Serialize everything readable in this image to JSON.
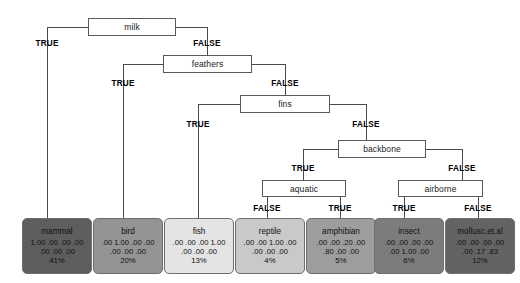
{
  "diagram": {
    "type": "decision-tree",
    "internal_nodes": [
      {
        "id": "milk",
        "label": "milk",
        "x": 88,
        "y": 18,
        "w": 88,
        "h": 18
      },
      {
        "id": "feathers",
        "label": "feathers",
        "x": 163,
        "y": 55,
        "w": 89,
        "h": 18
      },
      {
        "id": "fins",
        "label": "fins",
        "x": 240,
        "y": 95,
        "w": 90,
        "h": 18
      },
      {
        "id": "backbone",
        "label": "backbone",
        "x": 338,
        "y": 140,
        "w": 88,
        "h": 18
      },
      {
        "id": "aquatic",
        "label": "aquatic",
        "x": 262,
        "y": 180,
        "w": 84,
        "h": 17
      },
      {
        "id": "airborne",
        "label": "airborne",
        "x": 398,
        "y": 180,
        "w": 85,
        "h": 17
      }
    ],
    "edge_labels": [
      {
        "id": "milk-true",
        "text": "TRUE",
        "x": 47,
        "y": 39
      },
      {
        "id": "milk-false",
        "text": "FALSE",
        "x": 207,
        "y": 39
      },
      {
        "id": "feathers-true",
        "text": "TRUE",
        "x": 123,
        "y": 79
      },
      {
        "id": "feathers-false",
        "text": "FALSE",
        "x": 285,
        "y": 79
      },
      {
        "id": "fins-true",
        "text": "TRUE",
        "x": 198,
        "y": 120
      },
      {
        "id": "fins-false",
        "text": "FALSE",
        "x": 366,
        "y": 120
      },
      {
        "id": "backbone-true",
        "text": "TRUE",
        "x": 303,
        "y": 164
      },
      {
        "id": "backbone-false",
        "text": "FALSE",
        "x": 462,
        "y": 164
      },
      {
        "id": "aquatic-false",
        "text": "FALSE",
        "x": 267,
        "y": 204
      },
      {
        "id": "aquatic-true",
        "text": "TRUE",
        "x": 340,
        "y": 204
      },
      {
        "id": "airborne-true",
        "text": "TRUE",
        "x": 404,
        "y": 204
      },
      {
        "id": "airborne-false",
        "text": "FALSE",
        "x": 478,
        "y": 204
      }
    ],
    "leaves": [
      {
        "id": "mammal",
        "name": "mammal",
        "row1": "1.00 .00 .00 .00",
        "row2": ".00 .00 .00",
        "pct": "41%",
        "x": 22,
        "y": 218,
        "w": 70,
        "h": 56,
        "fill": "#5e5e5e"
      },
      {
        "id": "bird",
        "name": "bird",
        "row1": ".00 1.00 .00 .00",
        "row2": ".00 .00 .00",
        "pct": "20%",
        "x": 93,
        "y": 218,
        "w": 70,
        "h": 56,
        "fill": "#949494"
      },
      {
        "id": "fish",
        "name": "fish",
        "row1": ".00 .00 .00 1.00",
        "row2": ".00 .00 .00",
        "pct": "13%",
        "x": 164,
        "y": 218,
        "w": 70,
        "h": 56,
        "fill": "#e4e4e4"
      },
      {
        "id": "reptile",
        "name": "reptile",
        "row1": ".00 .00 1.00 .00",
        "row2": ".00 .00 .00",
        "pct": "4%",
        "x": 235,
        "y": 218,
        "w": 70,
        "h": 56,
        "fill": "#c9c9c9"
      },
      {
        "id": "amphibian",
        "name": "amphibian",
        "row1": ".00 .00 .20 .00",
        "row2": ".80 .00 .00",
        "pct": "5%",
        "x": 306,
        "y": 218,
        "w": 70,
        "h": 56,
        "fill": "#9d9d9d"
      },
      {
        "id": "insect",
        "name": "insect",
        "row1": ".00 .00 .00 .00",
        "row2": ".00 1.00 .00",
        "pct": "6%",
        "x": 374,
        "y": 218,
        "w": 70,
        "h": 56,
        "fill": "#7c7c7c"
      },
      {
        "id": "mollusc",
        "name": "mollusc.et.al",
        "row1": ".00 .00 .00 .00",
        "row2": ".00 .17 .83",
        "pct": "12%",
        "x": 445,
        "y": 218,
        "w": 70,
        "h": 56,
        "fill": "#636363"
      }
    ],
    "colors": {
      "background": "#ffffff",
      "edge_stroke": "#4a4a4a",
      "node_border": "#5a5a5a",
      "text": "#101010"
    }
  }
}
